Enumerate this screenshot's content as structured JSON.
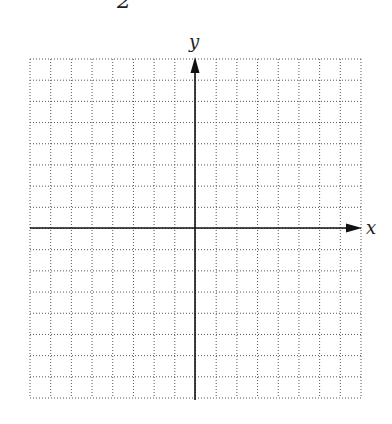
{
  "top_label": "2",
  "axes": {
    "x_label": "x",
    "y_label": "y"
  },
  "grid": {
    "columns": 16,
    "rows": 16,
    "style": "dotted",
    "color": "#555555"
  },
  "colors": {
    "axis": "#111111",
    "background": "#ffffff"
  }
}
